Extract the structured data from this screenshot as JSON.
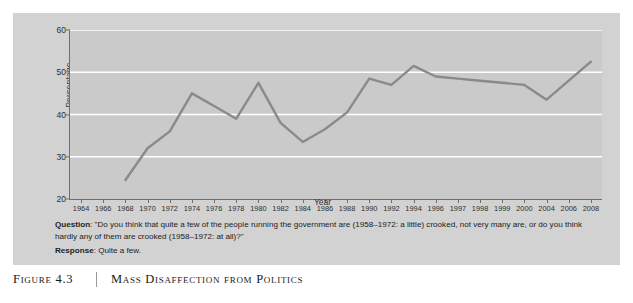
{
  "figure": {
    "number": "Figure 4.3",
    "title": "Mass Disaffection from Politics",
    "panel_color": "#d2d2d2",
    "plot_background": "#cacaca",
    "line_color": "#8a8a8a",
    "gridline_color": "#ffffff",
    "axis_color": "#6e6e6e"
  },
  "caption": {
    "question_label": "Question",
    "question_text": ": \"Do you think that quite a few of the people running the government are (1958–1972: a little) crooked, not very many are, or do you think hardly any of them are crooked (1958–1972: at all)?\"",
    "response_label": "Response",
    "response_text": ": Quite a few."
  },
  "chart_data": {
    "type": "line",
    "title": "Mass Disaffection from Politics",
    "xlabel": "Year",
    "ylabel": "Percentage",
    "ylim": [
      20,
      60
    ],
    "yticks": [
      20,
      30,
      40,
      50,
      60
    ],
    "grid": true,
    "gridlines_at": [
      30,
      40,
      50,
      60
    ],
    "legend": "none",
    "categories": [
      "1964",
      "1966",
      "1968",
      "1970",
      "1972",
      "1974",
      "1976",
      "1978",
      "1980",
      "1982",
      "1984",
      "1986",
      "1988",
      "1990",
      "1992",
      "1994",
      "1996",
      "1997",
      "1998",
      "1999",
      "2000",
      "2004",
      "2006",
      "2008"
    ],
    "values": [
      null,
      null,
      24.5,
      32.0,
      36.0,
      45.0,
      42.0,
      39.0,
      47.5,
      38.0,
      33.5,
      36.5,
      40.5,
      48.5,
      47.0,
      51.5,
      49.0,
      48.5,
      48.0,
      47.5,
      47.0,
      43.5,
      48.0,
      52.5
    ],
    "series": [
      {
        "name": "Quite a few",
        "points": [
          {
            "x": "1968",
            "y": 24.5
          },
          {
            "x": "1970",
            "y": 32.0
          },
          {
            "x": "1972",
            "y": 36.0
          },
          {
            "x": "1974",
            "y": 45.0
          },
          {
            "x": "1976",
            "y": 42.0
          },
          {
            "x": "1978",
            "y": 39.0
          },
          {
            "x": "1980",
            "y": 47.5
          },
          {
            "x": "1982",
            "y": 38.0
          },
          {
            "x": "1984",
            "y": 33.5
          },
          {
            "x": "1986",
            "y": 36.5
          },
          {
            "x": "1988",
            "y": 40.5
          },
          {
            "x": "1990",
            "y": 48.5
          },
          {
            "x": "1992",
            "y": 47.0
          },
          {
            "x": "1994",
            "y": 51.5
          },
          {
            "x": "1996",
            "y": 49.0
          },
          {
            "x": "1997",
            "y": 48.5
          },
          {
            "x": "1998",
            "y": 48.0
          },
          {
            "x": "1999",
            "y": 47.5
          },
          {
            "x": "2000",
            "y": 47.0
          },
          {
            "x": "2004",
            "y": 43.5
          },
          {
            "x": "2006",
            "y": 48.0
          },
          {
            "x": "2008",
            "y": 52.5
          }
        ]
      }
    ]
  }
}
